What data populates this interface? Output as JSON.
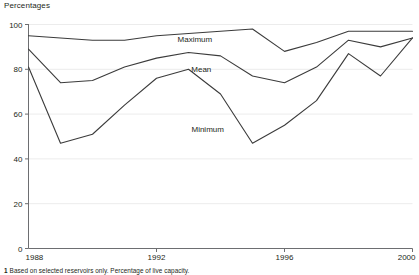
{
  "axis_unit_label": "Percentages",
  "footnote": {
    "marker": "1",
    "text": "Based on selected reservoirs only. Percentage of live capacity."
  },
  "colors": {
    "line": "#3b3b3b",
    "axis": "#6d6e71",
    "grid": "#ececec",
    "text": "#231f20",
    "background": "#ffffff"
  },
  "chart_data": {
    "type": "line",
    "title": "",
    "subtitle": "",
    "xlabel": "",
    "ylabel": "Percentages",
    "xlim": [
      1988,
      2000
    ],
    "ylim": [
      0,
      100
    ],
    "yticks": [
      0,
      20,
      40,
      60,
      80,
      100
    ],
    "ytick_labels": [
      "0",
      "20",
      "40",
      "60",
      "80",
      "100"
    ],
    "xticks": [
      1988,
      1992,
      1996,
      2000
    ],
    "xtick_labels": [
      "1988",
      "1992",
      "1996",
      "2000"
    ],
    "grid": true,
    "grid_axis": "y",
    "legend_position": "inline-annotations",
    "x": [
      1988,
      1989,
      1990,
      1991,
      1992,
      1993,
      1994,
      1995,
      1996,
      1997,
      1998,
      1999,
      2000
    ],
    "series": [
      {
        "name": "Maximum",
        "values": [
          95,
          94,
          93,
          93,
          95,
          96,
          97,
          98,
          88,
          92,
          97,
          97,
          97
        ],
        "label_x": 1993.2,
        "label_y": 92
      },
      {
        "name": "Mean",
        "values": [
          89,
          74,
          75,
          81,
          85,
          87.5,
          86,
          77,
          74,
          81,
          93,
          90,
          94
        ],
        "label_x": 1993.4,
        "label_y": 79
      },
      {
        "name": "Minimum",
        "values": [
          81,
          47,
          51,
          64,
          76,
          80,
          69,
          47,
          55,
          66,
          87,
          77,
          94
        ],
        "label_x": 1993.6,
        "label_y": 52
      }
    ]
  }
}
